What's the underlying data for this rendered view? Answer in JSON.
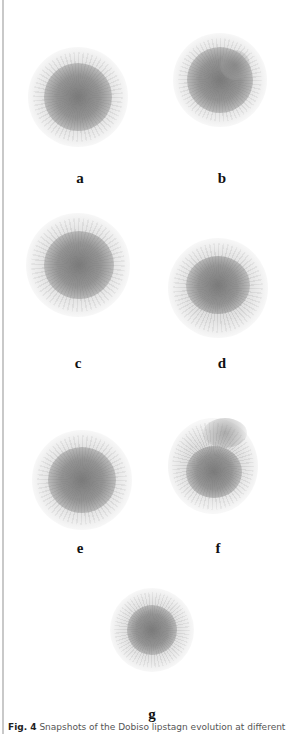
{
  "figure": {
    "panels": [
      {
        "label": "a",
        "cx": 78,
        "cy": 97,
        "r": 38,
        "label_x": 80,
        "label_y": 170
      },
      {
        "label": "b",
        "cx": 220,
        "cy": 80,
        "r": 35,
        "label_x": 222,
        "label_y": 170
      },
      {
        "label": "c",
        "cx": 78,
        "cy": 265,
        "r": 40,
        "label_x": 78,
        "label_y": 355
      },
      {
        "label": "d",
        "cx": 218,
        "cy": 288,
        "r": 38,
        "label_x": 222,
        "label_y": 355
      },
      {
        "label": "e",
        "cx": 82,
        "cy": 480,
        "r": 38,
        "label_x": 80,
        "label_y": 540
      },
      {
        "label": "f",
        "cx": 213,
        "cy": 465,
        "r": 35,
        "label_x": 218,
        "label_y": 540
      },
      {
        "label": "g",
        "cx": 152,
        "cy": 630,
        "r": 32,
        "label_x": 152,
        "label_y": 706
      }
    ],
    "caption": {
      "prefix": "Fig. 4",
      "text": "Snapshots of the Dobiso lipstagn evolution at different st"
    }
  },
  "colors": {
    "cluster_core": "#777777",
    "cluster_edge": "#bbbbbb",
    "label": "#111111",
    "left_rule": "#c9c9c9"
  }
}
